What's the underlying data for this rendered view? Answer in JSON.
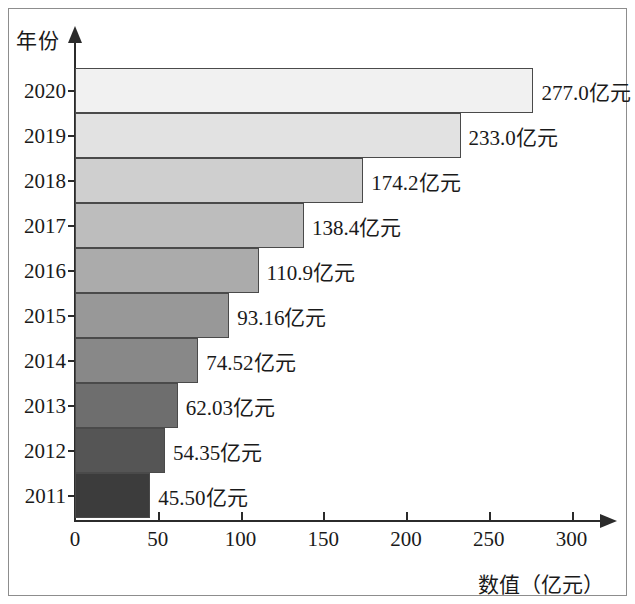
{
  "chart_data": {
    "type": "bar",
    "orientation": "horizontal",
    "title": "",
    "xlabel": "数值（亿元）",
    "ylabel": "年份",
    "xlim": [
      0,
      320
    ],
    "ylim": null,
    "grid": false,
    "legend": null,
    "xticks": [
      "0",
      "50",
      "100",
      "150",
      "200",
      "250",
      "300"
    ],
    "xtick_values": [
      0,
      50,
      100,
      150,
      200,
      250,
      300
    ],
    "categories": [
      "2020",
      "2019",
      "2018",
      "2017",
      "2016",
      "2015",
      "2014",
      "2013",
      "2012",
      "2011"
    ],
    "values": [
      277.0,
      233.0,
      174.2,
      138.4,
      110.9,
      93.16,
      74.52,
      62.03,
      54.35,
      45.5
    ],
    "data_labels": [
      "277.0亿元",
      "233.0亿元",
      "174.2亿元",
      "138.4亿元",
      "110.9亿元",
      "93.16亿元",
      "74.52亿元",
      "62.03亿元",
      "54.35亿元",
      "45.50亿元"
    ],
    "bar_colors": [
      "#f1f1f1",
      "#e2e2e2",
      "#cfcfcf",
      "#bdbdbd",
      "#ababab",
      "#989898",
      "#888888",
      "#6e6e6e",
      "#555555",
      "#3c3c3c"
    ],
    "bar_border_color": "#4a4a4a",
    "axis_color": "#2b2b2b",
    "text_color": "#1a1a1a",
    "unit": "亿元"
  }
}
